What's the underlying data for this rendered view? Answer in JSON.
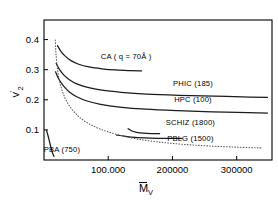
{
  "figure": {
    "background_color": "#ffffff",
    "frame_color": "#000000",
    "curve_color": "#1a1a1a",
    "dotted_color": "#555555"
  },
  "axes": {
    "x_title": "M",
    "x_title_sub": "V",
    "y_title": "v",
    "y_title_sub": "2",
    "y_title_sup": "'",
    "x_ticks": [
      "100.000",
      "200000",
      "300000"
    ],
    "x_tick_values": [
      100000,
      200000,
      300000
    ],
    "y_ticks": [
      "0.4",
      "0.3",
      "0.2",
      "0.1"
    ],
    "y_tick_values": [
      0.4,
      0.3,
      0.2,
      0.1
    ],
    "xlim": [
      0,
      355000
    ],
    "ylim": [
      0,
      0.465
    ],
    "grid": false
  },
  "chart_data": {
    "type": "line",
    "title": "",
    "subtitle": "",
    "xlabel": "M̄v",
    "ylabel": "v₂'",
    "xlim": [
      0,
      355000
    ],
    "ylim": [
      0,
      0.465
    ],
    "xticks": [
      100000,
      200000,
      300000
    ],
    "xticklabels": [
      "100.000",
      "200000",
      "300000"
    ],
    "yticks": [
      0.1,
      0.2,
      0.3,
      0.4
    ],
    "yticklabels": [
      "0.1",
      "0.2",
      "0.3",
      "0.4"
    ],
    "grid": false,
    "legend": "inline-annotations",
    "series": [
      {
        "name": "CA (q=70Å)",
        "label": "CA ( q = 70Å )",
        "style": "solid",
        "label_x": 128000,
        "label_y": 0.337,
        "x": [
          21000,
          26000,
          33000,
          42000,
          54000,
          70000,
          90000,
          112000,
          134000,
          152000
        ],
        "y": [
          0.38,
          0.362,
          0.345,
          0.33,
          0.318,
          0.309,
          0.303,
          0.299,
          0.297,
          0.296
        ]
      },
      {
        "name": "PHIC (185)",
        "label": "PHIC (185)",
        "style": "solid",
        "label_x": 232000,
        "label_y": 0.247,
        "x": [
          19000,
          24000,
          31000,
          40000,
          52000,
          68000,
          90000,
          120000,
          160000,
          210000,
          265000,
          320000,
          348000
        ],
        "y": [
          0.321,
          0.301,
          0.282,
          0.266,
          0.252,
          0.241,
          0.232,
          0.225,
          0.219,
          0.215,
          0.212,
          0.209,
          0.208
        ]
      },
      {
        "name": "HPC (100)",
        "label": "HPC (100)",
        "style": "solid",
        "label_x": 232000,
        "label_y": 0.193,
        "x": [
          18000,
          23000,
          30000,
          39000,
          51000,
          67000,
          88000,
          118000,
          158000,
          208000,
          262000,
          318000,
          348000
        ],
        "y": [
          0.293,
          0.269,
          0.247,
          0.227,
          0.21,
          0.196,
          0.185,
          0.176,
          0.169,
          0.164,
          0.16,
          0.157,
          0.156
        ]
      },
      {
        "name": "SCHIZ (1800)",
        "label": "SCHIZ (1800)",
        "style": "solid",
        "label_x": 228000,
        "label_y": 0.116,
        "x": [
          131000,
          136000,
          144000,
          155000,
          168000,
          180000
        ],
        "y": [
          0.104,
          0.097,
          0.092,
          0.089,
          0.088,
          0.088
        ]
      },
      {
        "name": "PBLG (1500)",
        "label": "PBLG (1500)",
        "style": "solid",
        "label_x": 228000,
        "label_y": 0.062,
        "x": [
          113000,
          125000,
          142000,
          165000,
          192000,
          215000
        ],
        "y": [
          0.083,
          0.079,
          0.075,
          0.073,
          0.072,
          0.072
        ]
      },
      {
        "name": "PBA (750)",
        "label": "PBA (750)",
        "style": "solid",
        "label_x": 28000,
        "label_y": 0.028,
        "x": [
          4000,
          6000,
          8500,
          11000,
          13500,
          15500
        ],
        "y": [
          0.098,
          0.083,
          0.062,
          0.04,
          0.022,
          0.012
        ]
      },
      {
        "name": "dotted-envelope",
        "label": "",
        "style": "dotted",
        "x": [
          17500,
          18500,
          20000,
          23000,
          28000,
          36000,
          48000,
          64000,
          86000,
          115000,
          150000,
          195000,
          245000,
          295000,
          340000
        ],
        "y": [
          0.398,
          0.36,
          0.32,
          0.274,
          0.232,
          0.192,
          0.157,
          0.128,
          0.104,
          0.084,
          0.068,
          0.056,
          0.048,
          0.043,
          0.04
        ]
      }
    ]
  }
}
